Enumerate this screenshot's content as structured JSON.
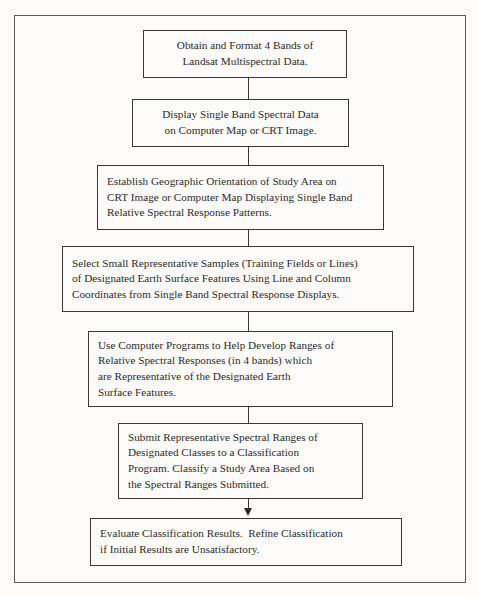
{
  "diagram": {
    "type": "flowchart",
    "orientation": "top-to-bottom",
    "title": "",
    "background_color": "#fdfcfa",
    "border_color": "#5a5a58",
    "box_border_color": "#3a3a38",
    "text_color": "#2b2b2a",
    "nodes": [
      {
        "id": "node-1",
        "align": "center",
        "lines": [
          "Obtain and Format 4 Bands of",
          "Landsat Multispectral Data."
        ]
      },
      {
        "id": "node-2",
        "align": "center",
        "lines": [
          "Display Single Band Spectral Data",
          "on Computer Map or CRT Image."
        ]
      },
      {
        "id": "node-3",
        "align": "left",
        "lines": [
          "Establish Geographic Orientation of Study Area on",
          "CRT Image or Computer Map Displaying Single Band",
          "Relative Spectral Response Patterns."
        ]
      },
      {
        "id": "node-4",
        "align": "left",
        "lines": [
          "Select Small Representative Samples (Training Fields or Lines)",
          "of Designated Earth Surface Features Using Line and Column",
          "Coordinates from Single Band Spectral Response Displays."
        ]
      },
      {
        "id": "node-5",
        "align": "left",
        "lines": [
          "Use Computer Programs to Help Develop Ranges of",
          "Relative Spectral Responses (in 4 bands) which",
          "are Representative of the Designated Earth",
          "Surface Features."
        ]
      },
      {
        "id": "node-6",
        "align": "left",
        "lines": [
          "Submit Representative Spectral Ranges of",
          "Designated Classes to a Classification",
          "Program. Classify a Study Area Based on",
          "the Spectral Ranges Submitted."
        ]
      },
      {
        "id": "node-7",
        "align": "left",
        "lines": [
          "Evaluate Classification Results.  Refine Classification",
          "if Initial Results are Unsatisfactory."
        ]
      }
    ],
    "connectors": [
      {
        "from": "node-1",
        "to": "node-2",
        "arrow": false
      },
      {
        "from": "node-2",
        "to": "node-3",
        "arrow": false
      },
      {
        "from": "node-3",
        "to": "node-4",
        "arrow": false
      },
      {
        "from": "node-4",
        "to": "node-5",
        "arrow": false
      },
      {
        "from": "node-5",
        "to": "node-6",
        "arrow": false
      },
      {
        "from": "node-6",
        "to": "node-7",
        "arrow": true
      }
    ]
  }
}
